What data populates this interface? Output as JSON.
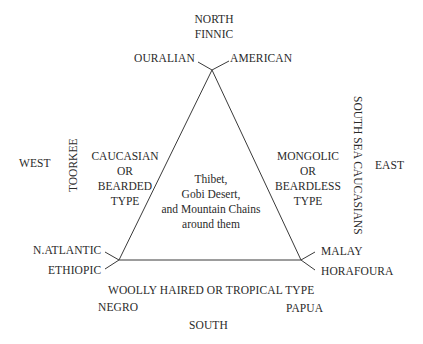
{
  "diagram": {
    "compass": {
      "north": "NORTH",
      "south": "SOUTH",
      "west": "WEST",
      "east": "EAST"
    },
    "vertices": {
      "top": {
        "upper_label": "FINNIC",
        "left_label": "OURALIAN",
        "right_label": "AMERICAN"
      },
      "bottom_left": {
        "upper_label": "N.ATLANTIC",
        "lower_label": "ETHIOPIC"
      },
      "bottom_right": {
        "upper_label": "MALAY",
        "lower_label": "HORAFOURA"
      }
    },
    "sides": {
      "left": {
        "lines": [
          "CAUCASIAN",
          "OR",
          "BEARDED",
          "TYPE"
        ],
        "outer_label": "TOORKEE"
      },
      "right": {
        "lines": [
          "MONGOLIC",
          "OR",
          "BEARDLESS",
          "TYPE"
        ],
        "outer_label": "SOUTH SEA CAUCASIANS"
      },
      "bottom": {
        "label": "WOOLLY HAIRED OR TROPICAL TYPE",
        "left_sub": "NEGRO",
        "right_sub": "PAPUA"
      }
    },
    "center": {
      "lines": [
        "Thibet,",
        "Gobi Desert,",
        "and Mountain Chains",
        "around them"
      ]
    },
    "line_color": "#3a3a3a"
  }
}
